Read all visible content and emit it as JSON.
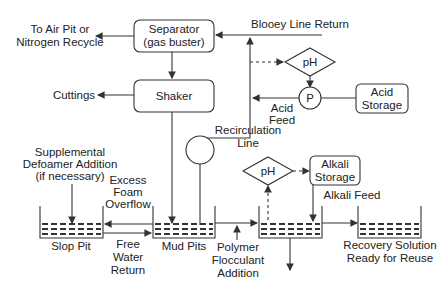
{
  "diagram": {
    "separator": [
      "Separator",
      "(gas buster)"
    ],
    "shaker": "Shaker",
    "to_air_pit": [
      "To Air Pit or",
      "Nitrogen Recycle"
    ],
    "cuttings": "Cuttings",
    "blooey": "Blooey Line Return",
    "ph_acid": "pH",
    "pump": "P",
    "acid_storage": [
      "Acid",
      "Storage"
    ],
    "acid_feed": [
      "Acid",
      "Feed"
    ],
    "recirc": [
      "Recirculation",
      "Line"
    ],
    "defoamer": [
      "Supplemental",
      "Defoamer Addition",
      "(if necessary)"
    ],
    "excess_foam": [
      "Excess",
      "Foam",
      "Overflow"
    ],
    "ph_alkali": "pH",
    "alkali_storage": [
      "Alkali",
      "Storage"
    ],
    "alkali_feed": "Alkali Feed",
    "slop_pit": "Slop Pit",
    "free_water": [
      "Free",
      "Water",
      "Return"
    ],
    "mud_pits": "Mud Pits",
    "polymer": [
      "Polymer",
      "Flocculant",
      "Addition"
    ],
    "recovery": [
      "Recovery Solution",
      "Ready for Reuse"
    ]
  }
}
